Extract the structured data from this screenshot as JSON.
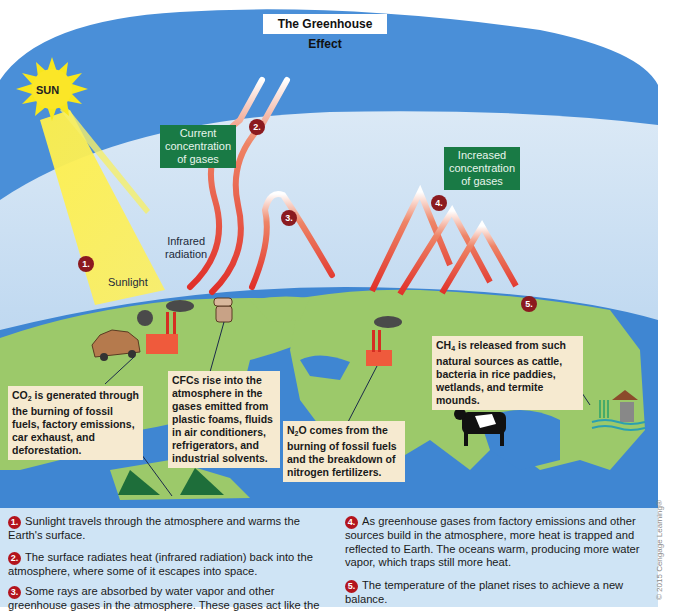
{
  "title": "The Greenhouse Effect",
  "sun": {
    "label": "SUN"
  },
  "labels": {
    "current_concentration": [
      "Current",
      "concentration",
      "of gases"
    ],
    "increased_concentration": [
      "Increased",
      "concentration",
      "of gases"
    ],
    "infrared_radiation": [
      "Infrared",
      "radiation"
    ],
    "sunlight": "Sunlight"
  },
  "badges": [
    "1.",
    "2.",
    "3.",
    "4.",
    "5."
  ],
  "callouts": {
    "co2": {
      "formula_main": "CO",
      "formula_sub": "2",
      "text_rest": " is generated through the burning of fossil fuels, factory emissions, car exhaust, and deforestation."
    },
    "cfc": {
      "text": "CFCs rise into the atmosphere in the gases emitted from plastic foams, fluids in air conditioners, refrigerators, and industrial solvents."
    },
    "n2o": {
      "formula_main": "N",
      "formula_sub": "2",
      "formula_after": "O",
      "text_rest": " comes from the burning of fossil fuels and the breakdown of nitrogen fertilizers."
    },
    "ch4": {
      "formula_main": "CH",
      "formula_sub": "4",
      "text_rest": " is released from such natural sources as cattle, bacteria in rice paddies, wetlands, and termite mounds."
    }
  },
  "legend": [
    {
      "num": "1.",
      "text": "Sunlight travels through the atmosphere and warms the Earth's surface."
    },
    {
      "num": "2.",
      "text": "The surface radiates heat (infrared radiation) back into the atmosphere, where some of it escapes into space."
    },
    {
      "num": "3.",
      "text": "Some rays are absorbed by water vapor and other greenhouse gases in the atmosphere. These gases act like the"
    },
    {
      "num": "4.",
      "text": "As greenhouse gases from factory emissions and other sources build in the atmosphere, more heat is trapped and reflected to Earth. The oceans warm, producing more water vapor, which traps still more heat."
    },
    {
      "num": "5.",
      "text": "The temperature of the planet rises to achieve a new balance."
    }
  ],
  "copyright": "© 2015 Cengage Learning®",
  "colors": {
    "sky_outer": "#4a8fd8",
    "sky_inner": "#c7def3",
    "ocean": "#3f86d2",
    "land": "#9cc96a",
    "radiation": "#e0332b",
    "label_green": "#197a45",
    "badge": "#8b1a1f",
    "callout_bg": "#f6ead0",
    "legend_bg": "#cfe4f5"
  }
}
